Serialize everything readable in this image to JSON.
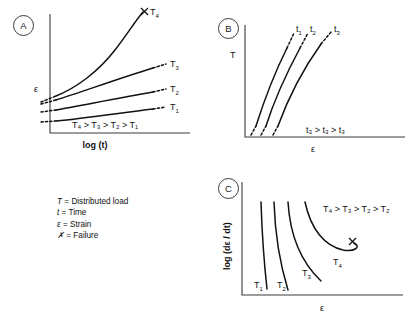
{
  "figure": {
    "panels": [
      {
        "id": "A",
        "badge": "A",
        "y_axis": "ε",
        "x_axis": "log (t)",
        "inequality": "T₄ > T₃ > T₂ > T₁",
        "curve_labels": [
          "T₄",
          "T₃",
          "T₂",
          "T₁"
        ],
        "failure_marker": "✗",
        "description": "Strain versus log time creep curves for four distributed load levels"
      },
      {
        "id": "B",
        "badge": "B",
        "y_axis": "T",
        "x_axis": "ε",
        "inequality": "t₃ > t₃ > t₃",
        "curve_labels": [
          "t₁",
          "t₂",
          "t₃"
        ],
        "description": "Distributed load versus strain isochronous curves at three times"
      },
      {
        "id": "C",
        "badge": "C",
        "y_axis": "log (dε / dt)",
        "x_axis": "ε",
        "inequality": "T₄ > T₃ > T₂ > T₂",
        "curve_labels": [
          "T₁",
          "T₂",
          "T₃",
          "T₄"
        ],
        "failure_marker": "✗",
        "description": "Log strain rate versus strain for four distributed load levels"
      }
    ],
    "legend": {
      "items": [
        {
          "symbol": "T",
          "sep": "=",
          "text": "Distributed load"
        },
        {
          "symbol": "t",
          "sep": "=",
          "text": "Time"
        },
        {
          "symbol": "ε",
          "sep": "=",
          "text": "Strain"
        },
        {
          "symbol": "✗",
          "sep": "=",
          "text": "Failure"
        }
      ]
    },
    "colors": {
      "ink": "#111111",
      "axis": "#3a3a3a",
      "background": "#ffffff"
    }
  }
}
